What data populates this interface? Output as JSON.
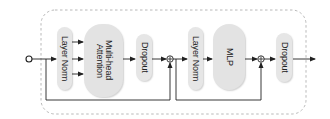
{
  "diagram": {
    "container": {
      "style": "dashed rounded rectangle",
      "color": "#aaaaaa"
    },
    "blocks": [
      {
        "id": "ln1",
        "label": "Layer Norm"
      },
      {
        "id": "mha",
        "label": "Multi-head\nAttention"
      },
      {
        "id": "drop1",
        "label": "Dropout"
      },
      {
        "id": "ln2",
        "label": "Layer Norm"
      },
      {
        "id": "mlp",
        "label": "MLP"
      },
      {
        "id": "drop2",
        "label": "Dropout"
      }
    ],
    "adders": [
      {
        "id": "add1",
        "symbol": "+"
      },
      {
        "id": "add2",
        "symbol": "+"
      }
    ],
    "colors": {
      "block_fill": "#e6e6e6",
      "line": "#222222",
      "dashed_border": "#b0b0b0"
    }
  }
}
